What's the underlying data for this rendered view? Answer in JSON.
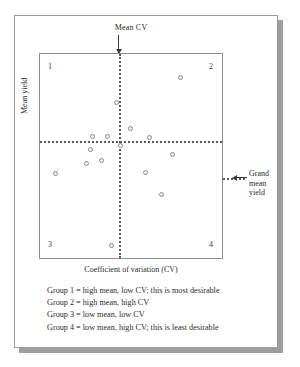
{
  "figure": {
    "annotations": {
      "mean_cv_label": "Mean CV",
      "grand_mean_line1": "Grand",
      "grand_mean_line2": "mean",
      "grand_mean_line3": "yield"
    },
    "quadrant_labels": [
      "1",
      "2",
      "3",
      "4"
    ],
    "caption_lines": [
      "Group 1 = high mean, low CV; this is most desirable",
      "Group 2 = high mean, high CV",
      "Group 3 = low mean, low CV",
      "Group 4 = low mean, high CV; this is least desirable"
    ],
    "colors": {
      "marker_stroke": "#8c8c8c",
      "marker_fill": "#f2f2f2",
      "divider": "#5a5a5a",
      "frame": "#8d8d8d",
      "card_shadow": "#9e9e9e"
    }
  },
  "chart_data": {
    "type": "scatter",
    "title": "",
    "xlabel": "Coefficient of variation (CV)",
    "ylabel": "Mean yield",
    "xlim": [
      0,
      100
    ],
    "ylim": [
      0,
      100
    ],
    "grid": false,
    "legend": "none",
    "reference_lines": [
      {
        "orientation": "vertical",
        "value": 43.5,
        "label": "Mean CV",
        "style": "dotted"
      },
      {
        "orientation": "horizontal",
        "value": 57.3,
        "label": "Grand mean yield",
        "style": "dotted"
      }
    ],
    "quadrants": [
      {
        "id": "1",
        "position": "top-left",
        "meaning": "high mean, low CV; this is most desirable"
      },
      {
        "id": "2",
        "position": "top-right",
        "meaning": "high mean, high CV"
      },
      {
        "id": "3",
        "position": "bottom-left",
        "meaning": "low mean, low CV"
      },
      {
        "id": "4",
        "position": "bottom-right",
        "meaning": "low mean, high CV; this is least desirable"
      }
    ],
    "series": [
      {
        "name": "Genotypes",
        "points": [
          {
            "x": 77.2,
            "y": 88.3,
            "quadrant": "2"
          },
          {
            "x": 41.8,
            "y": 76.2,
            "quadrant": "1"
          },
          {
            "x": 49.5,
            "y": 63.6,
            "quadrant": "2"
          },
          {
            "x": 28.8,
            "y": 59.7,
            "quadrant": "1"
          },
          {
            "x": 37.0,
            "y": 59.7,
            "quadrant": "1"
          },
          {
            "x": 60.3,
            "y": 59.2,
            "quadrant": "2"
          },
          {
            "x": 72.8,
            "y": 50.5,
            "quadrant": "4"
          },
          {
            "x": 44.0,
            "y": 55.3,
            "quadrant": "4"
          },
          {
            "x": 27.7,
            "y": 53.4,
            "quadrant": "3"
          },
          {
            "x": 25.5,
            "y": 46.1,
            "quadrant": "3"
          },
          {
            "x": 33.7,
            "y": 47.6,
            "quadrant": "3"
          },
          {
            "x": 8.7,
            "y": 41.3,
            "quadrant": "3"
          },
          {
            "x": 58.2,
            "y": 41.7,
            "quadrant": "4"
          },
          {
            "x": 66.8,
            "y": 31.1,
            "quadrant": "4"
          },
          {
            "x": 39.1,
            "y": 6.3,
            "quadrant": "3"
          }
        ]
      }
    ]
  }
}
